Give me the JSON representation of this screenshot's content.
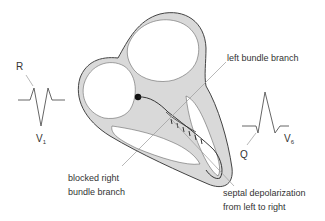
{
  "labels": {
    "left_bundle": "left bundle branch",
    "blocked_right_1": "blocked right",
    "blocked_right_2": "bundle branch",
    "septal_1": "septal depolarization",
    "septal_2": "from left to right",
    "R": "R",
    "Q": "Q",
    "V1_letter": "V",
    "V1_sub": "1",
    "V6_letter": "V",
    "V6_sub": "6"
  },
  "colors": {
    "wall_fill": "#d9d9d9",
    "outline": "#444444",
    "leader": "#9a9a9a",
    "trace": "#555555"
  }
}
